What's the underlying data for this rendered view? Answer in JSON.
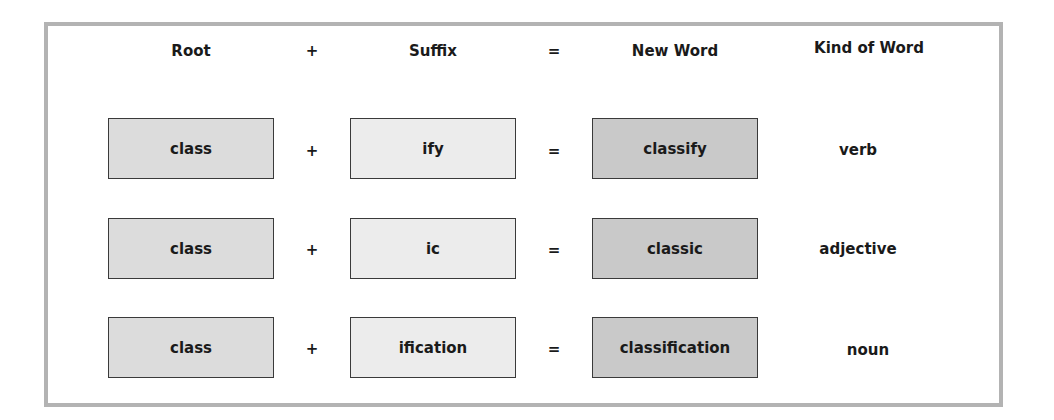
{
  "headers": {
    "root": "Root",
    "plus": "+",
    "suffix": "Suffix",
    "equals": "=",
    "new_word": "New Word",
    "kind": "Kind of Word"
  },
  "rows": [
    {
      "root": "class",
      "plus": "+",
      "suffix": "ify",
      "equals": "=",
      "new_word": "classify",
      "kind": "verb"
    },
    {
      "root": "class",
      "plus": "+",
      "suffix": "ic",
      "equals": "=",
      "new_word": "classic",
      "kind": "adjective"
    },
    {
      "root": "class",
      "plus": "+",
      "suffix": "ification",
      "equals": "=",
      "new_word": "classification",
      "kind": "noun"
    }
  ],
  "colors": {
    "frame": "#b3b3b3",
    "root_fill": "#dcdcdc",
    "suffix_fill": "#ececec",
    "new_word_fill": "#c9c9c9",
    "box_border": "#3a3a3a"
  }
}
